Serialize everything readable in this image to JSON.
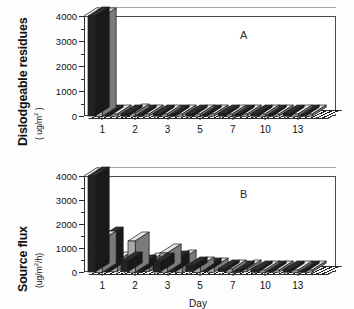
{
  "figure": {
    "panels": [
      {
        "letter": "A"
      },
      {
        "letter": "B"
      }
    ],
    "xtitle": "Day"
  },
  "panel_a": {
    "ytitle_main": "Dislodgeable residues",
    "ytitle_units": "( ug/m",
    "ytitle_exp": "2",
    "ytitle_close": " )",
    "letter": "A"
  },
  "panel_b": {
    "ytitle_main": "Source flux",
    "ytitle_units": "(ug/m",
    "ytitle_exp": "2",
    "ytitle_close": "/h)",
    "letter": "B",
    "xtitle": "Day"
  },
  "axis": {
    "y_ticks": [
      "0",
      "1000",
      "2000",
      "3000",
      "4000"
    ],
    "x_ticks": [
      "1",
      "2",
      "3",
      "5",
      "7",
      "10",
      "13"
    ]
  },
  "chart_data": [
    {
      "type": "bar",
      "title": "A",
      "xlabel": "Day",
      "ylabel": "Dislodgeable residues (ug/m2)",
      "ylim": [
        0,
        4000
      ],
      "ytick_values": [
        0,
        1000,
        2000,
        3000,
        4000
      ],
      "minor_tick_interval": 500,
      "grid": false,
      "legend": "none",
      "style": "3d-clustered-bar",
      "categories": [
        "1",
        "2",
        "3",
        "5",
        "7",
        "10",
        "13"
      ],
      "series": [
        {
          "name": "rep 1",
          "fill": "#232323",
          "values": [
            4000,
            40,
            30,
            25,
            20,
            15,
            12
          ]
        },
        {
          "name": "rep 2",
          "fill": "#a9a9a9",
          "values": [
            3980,
            120,
            45,
            30,
            22,
            18,
            14
          ]
        },
        {
          "name": "rep 3",
          "fill": "#232323",
          "values": [
            35,
            60,
            35,
            25,
            18,
            15,
            10
          ]
        },
        {
          "name": "rep 4",
          "fill": "#a9a9a9",
          "values": [
            45,
            55,
            40,
            28,
            20,
            16,
            12
          ]
        }
      ]
    },
    {
      "type": "bar",
      "title": "B",
      "xlabel": "Day",
      "ylabel": "Source flux (ug/m2/h)",
      "ylim": [
        0,
        4000
      ],
      "ytick_values": [
        0,
        1000,
        2000,
        3000,
        4000
      ],
      "minor_tick_interval": 500,
      "grid": false,
      "legend": "none",
      "style": "3d-clustered-bar",
      "categories": [
        "1",
        "2",
        "3",
        "5",
        "7",
        "10",
        "13"
      ],
      "series": [
        {
          "name": "rep 1",
          "fill": "#232323",
          "values": [
            4200,
            450,
            420,
            230,
            110,
            70,
            55
          ]
        },
        {
          "name": "rep 2",
          "fill": "#a9a9a9",
          "values": [
            1350,
            1300,
            800,
            270,
            130,
            85,
            60
          ]
        },
        {
          "name": "rep 3",
          "fill": "#232323",
          "values": [
            1500,
            350,
            500,
            200,
            100,
            65,
            50
          ]
        },
        {
          "name": "rep 4",
          "fill": "#a9a9a9",
          "values": [
            450,
            400,
            560,
            220,
            115,
            75,
            55
          ]
        }
      ]
    }
  ]
}
